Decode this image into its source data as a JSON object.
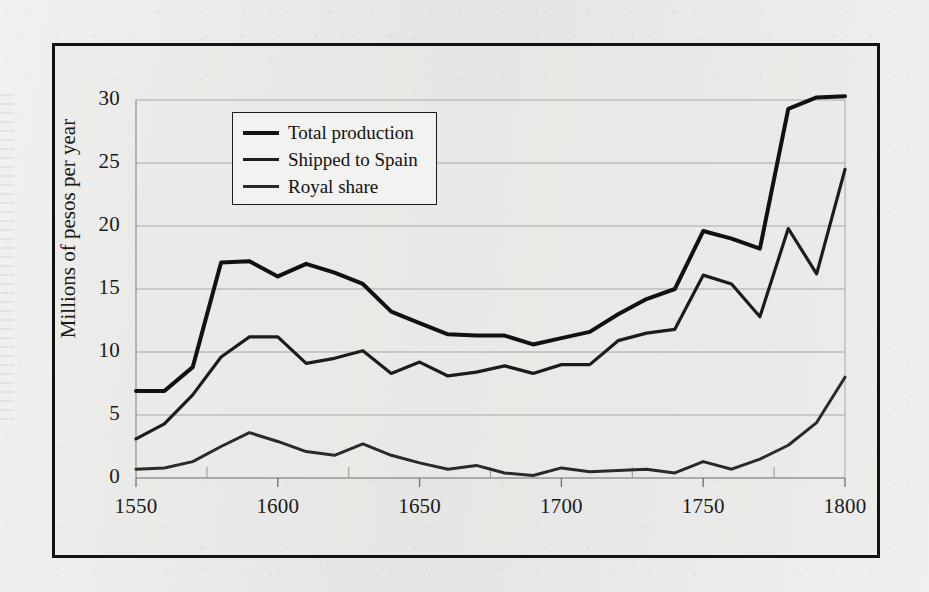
{
  "figure": {
    "background_color": "#e9e9e7",
    "frame_color": "#131313",
    "plot_background": "#eaeae8"
  },
  "axis": {
    "y_title": "Millions of pesos per year",
    "y_ticks": [
      "0",
      "5",
      "10",
      "15",
      "20",
      "25",
      "30"
    ],
    "x_ticks": [
      "1550",
      "1600",
      "1650",
      "1700",
      "1750",
      "1800"
    ]
  },
  "legend": {
    "entries": [
      {
        "label": "Total production",
        "color": "#111111",
        "width": 4.0
      },
      {
        "label": "Shipped to Spain",
        "color": "#1c1c1c",
        "width": 3.2
      },
      {
        "label": "Royal share",
        "color": "#2a2a2a",
        "width": 3.0
      }
    ]
  },
  "chart_data": {
    "type": "line",
    "title": "",
    "xlabel": "",
    "ylabel": "Millions of pesos per year",
    "xlim": [
      1550,
      1800
    ],
    "ylim": [
      0,
      30
    ],
    "y_ticks": [
      0,
      5,
      10,
      15,
      20,
      25,
      30
    ],
    "x_ticks": [
      1550,
      1600,
      1650,
      1700,
      1750,
      1800
    ],
    "x_minor_ticks": [
      1575,
      1625,
      1675,
      1725,
      1775
    ],
    "grid": "horizontal",
    "legend_position": "upper-left-inside",
    "x": [
      1550,
      1560,
      1570,
      1580,
      1590,
      1600,
      1610,
      1620,
      1630,
      1640,
      1650,
      1660,
      1670,
      1680,
      1690,
      1700,
      1710,
      1720,
      1730,
      1740,
      1750,
      1760,
      1770,
      1780,
      1790,
      1800
    ],
    "series": [
      {
        "name": "Total production",
        "color": "#111111",
        "line_width": 4.0,
        "values": [
          6.9,
          6.9,
          8.8,
          17.1,
          17.2,
          16.0,
          17.0,
          16.3,
          15.4,
          13.2,
          12.3,
          11.4,
          11.3,
          11.3,
          10.6,
          11.1,
          11.6,
          13.0,
          14.2,
          15.0,
          19.6,
          19.0,
          18.2,
          29.3,
          30.2,
          30.3
        ]
      },
      {
        "name": "Shipped to Spain",
        "color": "#1c1c1c",
        "line_width": 3.2,
        "values": [
          3.1,
          4.3,
          6.6,
          9.6,
          11.2,
          11.2,
          9.1,
          9.5,
          10.1,
          8.3,
          9.2,
          8.1,
          8.4,
          8.9,
          8.3,
          9.0,
          9.0,
          10.9,
          11.5,
          11.8,
          16.1,
          15.4,
          12.8,
          19.8,
          16.2,
          24.5
        ]
      },
      {
        "name": "Royal share",
        "color": "#2a2a2a",
        "line_width": 3.0,
        "values": [
          0.7,
          0.8,
          1.3,
          2.5,
          3.6,
          2.9,
          2.1,
          1.8,
          2.7,
          1.8,
          1.2,
          0.7,
          1.0,
          0.4,
          0.2,
          0.8,
          0.5,
          0.6,
          0.7,
          0.4,
          1.3,
          0.7,
          1.5,
          2.6,
          4.4,
          8.0
        ]
      }
    ]
  }
}
